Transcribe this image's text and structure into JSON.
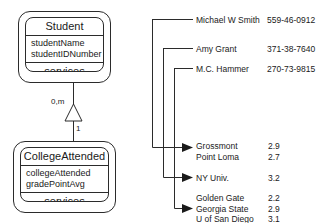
{
  "diagram": {
    "classes": [
      {
        "id": "student",
        "name": "Student",
        "attributes": [
          "studentName",
          "studentIDNumber"
        ],
        "operations": "services"
      },
      {
        "id": "college_attended",
        "name": "CollegeAttended",
        "attributes": [
          "collegeAttended",
          "gradePointAvg"
        ],
        "operations": "services"
      }
    ],
    "association": {
      "source_multiplicity": "0,m",
      "target_multiplicity": "1",
      "arrow_type": "generalization-triangle"
    },
    "students": [
      {
        "name": "Michael W Smith",
        "id_number": "559-46-0912"
      },
      {
        "name": "Amy Grant",
        "id_number": "371-38-7640"
      },
      {
        "name": "M.C. Hammer",
        "id_number": "270-73-9815"
      }
    ],
    "colleges": [
      {
        "group": 1,
        "name": "Grossmont",
        "gpa": "2.9"
      },
      {
        "group": 1,
        "name": "Point Loma",
        "gpa": "2.7"
      },
      {
        "group": 2,
        "name": "NY Univ.",
        "gpa": "3.2"
      },
      {
        "group": 3,
        "name": "Golden Gate",
        "gpa": "2.2"
      },
      {
        "group": 3,
        "name": "Georgia State",
        "gpa": "2.9"
      },
      {
        "group": 3,
        "name": "U of San Diego",
        "gpa": "3.1"
      }
    ]
  },
  "colors": {
    "line": "#2b2b2b",
    "text": "#1a1a1a",
    "background": "#ffffff"
  }
}
